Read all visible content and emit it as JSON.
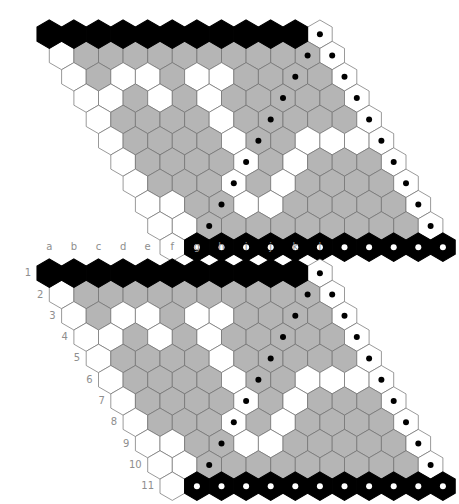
{
  "page": {
    "background": "#ffffff",
    "boards": [
      {
        "name": "board-top",
        "labels_visible": false,
        "x": 33,
        "y": 16
      },
      {
        "name": "board-bottom",
        "labels_visible": true,
        "x": 33,
        "y": 255
      }
    ]
  },
  "colors": {
    "black": "#000000",
    "gray": "#b5b5b5",
    "white": "#ffffff",
    "stroke": "#6f6f6f",
    "label": "#8e8e8e",
    "dot_on_light": "#000000",
    "dot_on_black": "#ffffff"
  },
  "geometry": {
    "cols": 12,
    "rows": 11,
    "hex_width": 24.6,
    "hex_height": 28.4,
    "row_step_y": 21.3,
    "row_step_x": 12.3,
    "dot_radius": 3.0
  },
  "labels": {
    "columns": [
      "a",
      "b",
      "c",
      "d",
      "e",
      "f",
      "g",
      "h",
      "i",
      "j",
      "k",
      "l"
    ],
    "rows": [
      "1",
      "2",
      "3",
      "4",
      "5",
      "6",
      "7",
      "8",
      "9",
      "10",
      "11"
    ]
  },
  "legend": {
    "black": "black stone / black edge",
    "gray": "gray region",
    "white": "white / empty",
    "dot": "marked cell"
  },
  "chart_data": {
    "type": "heatmap",
    "xlabel": "",
    "ylabel": "",
    "categories": [
      "a",
      "b",
      "c",
      "d",
      "e",
      "f",
      "g",
      "h",
      "i",
      "j",
      "k",
      "l"
    ],
    "rows": [
      "1",
      "2",
      "3",
      "4",
      "5",
      "6",
      "7",
      "8",
      "9",
      "10",
      "11"
    ],
    "cells": [
      [
        "K",
        "K",
        "K",
        "K",
        "K",
        "K",
        "K",
        "K",
        "K",
        "K",
        "K",
        "Wd"
      ],
      [
        "W",
        "G",
        "G",
        "G",
        "G",
        "G",
        "G",
        "G",
        "G",
        "G",
        "Gd",
        "Wd"
      ],
      [
        "W",
        "G",
        "W",
        "W",
        "G",
        "W",
        "W",
        "G",
        "G",
        "Gd",
        "G",
        "Wd"
      ],
      [
        "W",
        "W",
        "G",
        "W",
        "G",
        "W",
        "G",
        "G",
        "Gd",
        "G",
        "G",
        "Wd"
      ],
      [
        "W",
        "G",
        "G",
        "G",
        "G",
        "W",
        "G",
        "Gd",
        "G",
        "G",
        "G",
        "Wd"
      ],
      [
        "W",
        "G",
        "G",
        "G",
        "G",
        "W",
        "Gd",
        "G",
        "W",
        "W",
        "W",
        "Wd"
      ],
      [
        "W",
        "G",
        "G",
        "G",
        "G",
        "Wd",
        "G",
        "W",
        "G",
        "G",
        "G",
        "Wd"
      ],
      [
        "W",
        "G",
        "G",
        "G",
        "Wd",
        "G",
        "W",
        "G",
        "G",
        "G",
        "G",
        "Wd"
      ],
      [
        "W",
        "W",
        "G",
        "Gd",
        "W",
        "W",
        "G",
        "G",
        "G",
        "G",
        "G",
        "Wd"
      ],
      [
        "W",
        "W",
        "Gd",
        "G",
        "G",
        "G",
        "G",
        "G",
        "G",
        "G",
        "G",
        "Wd"
      ],
      [
        "W",
        "Kd",
        "Kd",
        "Kd",
        "Kd",
        "Kd",
        "Kd",
        "Kd",
        "Kd",
        "Kd",
        "Kd",
        "Kd"
      ]
    ],
    "key": {
      "K": "black",
      "G": "gray",
      "W": "white",
      "Kd": "black with white dot",
      "Gd": "gray with black dot",
      "Wd": "white with black dot"
    }
  }
}
